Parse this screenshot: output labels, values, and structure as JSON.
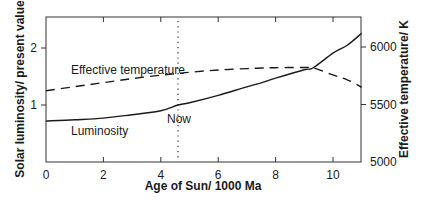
{
  "chart_data": {
    "type": "line",
    "title": "",
    "xlabel": "Age of Sun/ 1000 Ma",
    "ylabel": "Solar luminosity/ present value",
    "y2label": "Effective temperature/ K",
    "xlim": [
      0,
      11
    ],
    "ylim": [
      0,
      2.5
    ],
    "y2lim": [
      5000,
      6100
    ],
    "x_ticks": [
      "0",
      "2",
      "4",
      "6",
      "8",
      "10"
    ],
    "y_ticks": [
      "1",
      "2"
    ],
    "y2_ticks": [
      "5000",
      "5500",
      "6000"
    ],
    "grid": false,
    "legend": "none (inline labels)",
    "series": [
      {
        "name": "Luminosity",
        "axis": "left",
        "style": "solid",
        "x": [
          0,
          1,
          2,
          3,
          4,
          4.6,
          5,
          6,
          7,
          7.5,
          8,
          9,
          9.3,
          10,
          10.5,
          11
        ],
        "values": [
          0.72,
          0.74,
          0.77,
          0.83,
          0.9,
          1.0,
          1.04,
          1.17,
          1.32,
          1.39,
          1.47,
          1.62,
          1.65,
          1.91,
          2.05,
          2.26
        ]
      },
      {
        "name": "Effective temperature",
        "axis": "right",
        "style": "dashed",
        "x": [
          0,
          1,
          2,
          3,
          4,
          4.6,
          5,
          6,
          7,
          7.5,
          8,
          9,
          9.3,
          10,
          10.5,
          11
        ],
        "values": [
          5620,
          5655,
          5690,
          5725,
          5755,
          5770,
          5780,
          5800,
          5812,
          5817,
          5820,
          5822,
          5820,
          5757,
          5715,
          5650
        ]
      }
    ],
    "annotations": [
      {
        "text": "Effective temperature",
        "x": 0.8,
        "y_right": 5870
      },
      {
        "text": "Luminosity",
        "x": 0.8,
        "y": 0.42
      },
      {
        "text": "Now",
        "x": 4.6,
        "y": 0.62,
        "vertical_dotted_line_at_x": 4.6
      }
    ]
  },
  "labels": {
    "x_axis_title": "Age of Sun/ 1000 Ma",
    "y_axis_title": "Solar luminosity/ present value",
    "y2_axis_title": "Effective temperature/ K",
    "temp_curve_label": "Effective temperature",
    "lum_curve_label": "Luminosity",
    "now_label": "Now"
  },
  "colors": {
    "line": "#1a1a1a",
    "axis": "#333333",
    "dotted": "#444444"
  }
}
